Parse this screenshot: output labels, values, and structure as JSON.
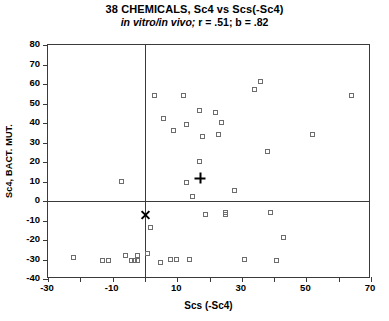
{
  "chart_data": {
    "type": "scatter",
    "title": "38 CHEMICALS, Sc4 vs Scs(-Sc4)",
    "subtitle_italic": "in vitro/in vivo;",
    "subtitle_rest": " r  =  .51;  b  =  .82",
    "subtitle_full": "in vitro/in vivo; r = .51; b = .82",
    "xlabel": "Scs (-Sc4)",
    "ylabel": "Sc4, BACT. MUT.",
    "xlim": [
      -30,
      70
    ],
    "ylim": [
      -40,
      80
    ],
    "xticks": [
      -30,
      -10,
      10,
      30,
      50,
      70
    ],
    "xtick_labels": [
      "-30",
      "-10",
      "10",
      "30",
      "50",
      "70"
    ],
    "xminor_ticks": [
      -20,
      0,
      20,
      40,
      60
    ],
    "yticks": [
      80,
      70,
      60,
      50,
      40,
      30,
      20,
      10,
      0,
      -10,
      -20,
      -30,
      -40
    ],
    "ytick_labels": [
      "80",
      "70",
      "60",
      "50",
      "40",
      "30",
      "20",
      "10",
      "0",
      "-10",
      "-20",
      "-30",
      "-40"
    ],
    "grid": false,
    "legend": null,
    "zero_lines": {
      "x": 0,
      "y": 0,
      "color": "#3a3a3a"
    },
    "marker_color": "#6d6d6d",
    "series": [
      {
        "name": "chemicals",
        "marker": "open-square",
        "points": [
          [
            -22,
            -29
          ],
          [
            -13,
            -31
          ],
          [
            -11,
            -31
          ],
          [
            -7,
            10
          ],
          [
            -6,
            -28
          ],
          [
            -4,
            -31
          ],
          [
            -3,
            -31
          ],
          [
            -2,
            -31
          ],
          [
            -2,
            -28
          ],
          [
            1,
            -27
          ],
          [
            2,
            -14
          ],
          [
            3,
            54
          ],
          [
            5,
            -32
          ],
          [
            6,
            42
          ],
          [
            8,
            -30
          ],
          [
            9,
            36
          ],
          [
            10,
            -30
          ],
          [
            12,
            54
          ],
          [
            13,
            39
          ],
          [
            13,
            9
          ],
          [
            14,
            -30
          ],
          [
            15,
            2
          ],
          [
            17,
            46
          ],
          [
            17,
            20
          ],
          [
            18,
            33
          ],
          [
            19,
            -7
          ],
          [
            22,
            45
          ],
          [
            23,
            34
          ],
          [
            24,
            40
          ],
          [
            25,
            -6
          ],
          [
            25,
            -7
          ],
          [
            28,
            5
          ],
          [
            31,
            -30
          ],
          [
            34,
            57
          ],
          [
            36,
            61
          ],
          [
            38,
            25
          ],
          [
            39,
            -6
          ],
          [
            41,
            -31
          ],
          [
            43,
            -19
          ],
          [
            52,
            34
          ],
          [
            64,
            54
          ]
        ]
      }
    ],
    "annotations": [
      {
        "name": "plus-marker",
        "marker": "plus",
        "x": 17,
        "y": 12
      },
      {
        "name": "cross-marker",
        "marker": "cross",
        "x": 0,
        "y": -7
      }
    ]
  }
}
